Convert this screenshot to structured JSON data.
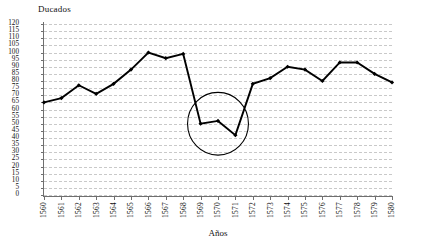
{
  "chart_data": {
    "type": "line",
    "title": "",
    "xlabel": "Años",
    "ylabel": "Ducados",
    "categories": [
      "1560",
      "1561",
      "1562",
      "1563",
      "1564",
      "1565",
      "1566",
      "1567",
      "1568",
      "1569",
      "1570",
      "1571",
      "1572",
      "1573",
      "1574",
      "1575",
      "1576",
      "1577",
      "1578",
      "1579",
      "1580"
    ],
    "values": [
      65,
      68,
      77,
      71,
      78,
      88,
      100,
      96,
      99,
      50,
      52,
      42,
      78,
      82,
      90,
      88,
      80,
      93,
      93,
      85,
      79
    ],
    "ylim": [
      0,
      120
    ],
    "ytick_step": 5,
    "yticks": [
      0,
      5,
      10,
      15,
      20,
      25,
      30,
      35,
      40,
      45,
      50,
      55,
      60,
      65,
      70,
      75,
      80,
      85,
      90,
      95,
      100,
      105,
      110,
      115,
      120
    ],
    "ytick_labels": [
      "0",
      "5",
      "10",
      "15",
      "20",
      "25",
      "30",
      "35",
      "40",
      "45",
      "50",
      "55",
      "60",
      "65",
      "70",
      "75",
      "80",
      "85",
      "90",
      "95",
      "100",
      "105",
      "110",
      "115",
      "120"
    ],
    "grid": true,
    "grid_style": "dashed-horizontal",
    "legend": false,
    "legend_position": "none",
    "series_color": "#000000",
    "marker": "diamond",
    "annotations": [
      {
        "type": "ellipse",
        "name": "dip-highlight-ellipse",
        "covers_years": [
          "1569",
          "1570",
          "1571"
        ],
        "center_x": 1570,
        "center_y": 50,
        "radius_x_years": 1.75,
        "radius_y_value": 22,
        "color": "#000000"
      }
    ]
  },
  "axis": {
    "y_title": "Ducados",
    "x_title": "Años"
  }
}
